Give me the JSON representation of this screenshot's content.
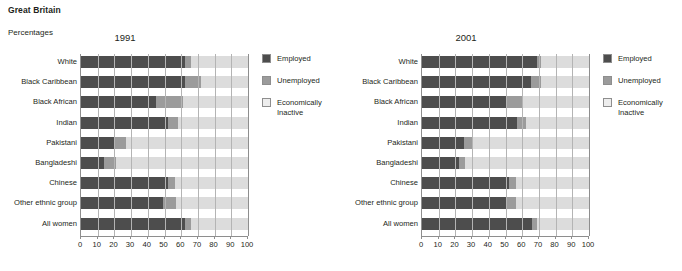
{
  "header": {
    "region": "Great Britain",
    "units": "Percentages"
  },
  "legend": {
    "items": [
      {
        "key": "employed",
        "label": "Employed",
        "color": "#4d4d4d"
      },
      {
        "key": "unemployed",
        "label": "Unemployed",
        "color": "#9b9b9b"
      },
      {
        "key": "inactive",
        "label": "Economically Inactive",
        "color": "#ededed"
      }
    ]
  },
  "panels": [
    {
      "id": "panel-1991",
      "title": "1991"
    },
    {
      "id": "panel-2001",
      "title": "2001"
    }
  ],
  "axis": {
    "ticks": [
      "0",
      "10",
      "20",
      "30",
      "40",
      "50",
      "60",
      "70",
      "80",
      "90",
      "100"
    ],
    "min": 0,
    "max": 100
  },
  "categories": [
    "White",
    "Black Caribbean",
    "Black African",
    "Indian",
    "Pakistani",
    "Bangladeshi",
    "Chinese",
    "Other ethnic group",
    "All women"
  ],
  "chart_data": [
    {
      "type": "bar",
      "orientation": "horizontal",
      "stacked": true,
      "title": "1991",
      "xlabel": "Percentages",
      "ylabel": "",
      "xlim": [
        0,
        100
      ],
      "grid": true,
      "legend_position": "right",
      "categories": [
        "White",
        "Black Caribbean",
        "Black African",
        "Indian",
        "Pakistani",
        "Bangladeshi",
        "Chinese",
        "Other ethnic group",
        "All women"
      ],
      "series": [
        {
          "name": "Employed",
          "values": [
            62,
            62,
            45,
            52,
            20,
            14,
            52,
            49,
            62
          ]
        },
        {
          "name": "Unemployed",
          "values": [
            4,
            10,
            16,
            6,
            7,
            7,
            4,
            8,
            4
          ]
        },
        {
          "name": "Economically Inactive",
          "values": [
            34,
            28,
            39,
            42,
            73,
            79,
            44,
            43,
            34
          ]
        }
      ]
    },
    {
      "type": "bar",
      "orientation": "horizontal",
      "stacked": true,
      "title": "2001",
      "xlabel": "Percentages",
      "ylabel": "",
      "xlim": [
        0,
        100
      ],
      "grid": true,
      "legend_position": "right",
      "categories": [
        "White",
        "Black Caribbean",
        "Black African",
        "Indian",
        "Pakistani",
        "Bangladeshi",
        "Chinese",
        "Other ethnic group",
        "All women"
      ],
      "series": [
        {
          "name": "Employed",
          "values": [
            69,
            65,
            50,
            57,
            25,
            22,
            52,
            51,
            66
          ]
        },
        {
          "name": "Unemployed",
          "values": [
            2,
            6,
            10,
            5,
            5,
            4,
            4,
            5,
            3
          ]
        },
        {
          "name": "Economically Inactive",
          "values": [
            29,
            29,
            40,
            38,
            70,
            74,
            44,
            44,
            31
          ]
        }
      ]
    }
  ]
}
